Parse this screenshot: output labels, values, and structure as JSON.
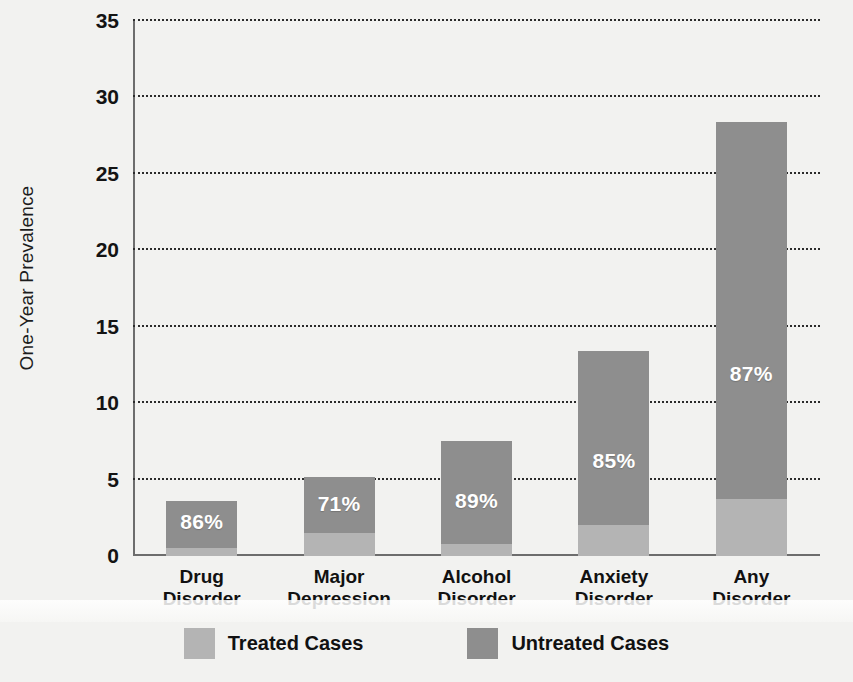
{
  "chart_data": {
    "type": "bar",
    "subtype": "stacked-bar",
    "title": "",
    "xlabel": "",
    "ylabel": "One-Year Prevalence",
    "ylim": [
      0,
      35
    ],
    "yticks": [
      0,
      5,
      10,
      15,
      20,
      25,
      30,
      35
    ],
    "ytick_labels": [
      "0",
      "5",
      "10",
      "15",
      "20",
      "25",
      "30",
      "35"
    ],
    "grid": true,
    "grid_style": "dotted",
    "legend_position": "bottom-center",
    "categories": [
      "Drug\nDisorder",
      "Major\nDepression",
      "Alcohol\nDisorder",
      "Anxiety\nDisorder",
      "Any\nDisorder"
    ],
    "category_lines": [
      [
        "Drug",
        "Disorder"
      ],
      [
        "Major",
        "Depression"
      ],
      [
        "Alcohol",
        "Disorder"
      ],
      [
        "Anxiety",
        "Disorder"
      ],
      [
        "Any",
        "Disorder"
      ]
    ],
    "series": [
      {
        "name": "Treated Cases",
        "color": "#b4b4b4",
        "values": [
          0.5,
          1.5,
          0.8,
          2.0,
          3.7
        ]
      },
      {
        "name": "Untreated Cases",
        "color": "#8e8e8e",
        "values": [
          3.1,
          3.7,
          6.7,
          11.4,
          24.7
        ]
      }
    ],
    "totals": [
      3.6,
      5.2,
      7.5,
      13.4,
      28.4
    ],
    "untreated_pct_labels": [
      "86%",
      "71%",
      "89%",
      "85%",
      "87%"
    ]
  },
  "axis": {
    "y_title": "One-Year Prevalence",
    "ticks": [
      "35",
      "30",
      "25",
      "20",
      "15",
      "10",
      "5",
      "0"
    ]
  },
  "legend": {
    "items": [
      {
        "label": "Treated Cases",
        "color": "#b4b4b4"
      },
      {
        "label": "Untreated Cases",
        "color": "#8e8e8e"
      }
    ]
  },
  "colors": {
    "treated": "#b4b4b4",
    "untreated": "#8e8e8e",
    "background": "#f2f2f0",
    "axis": "#6d6d6d",
    "text": "#111111",
    "label_text": "#ffffff"
  }
}
